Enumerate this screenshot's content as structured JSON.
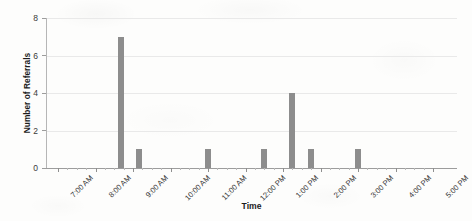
{
  "chart_data": {
    "type": "bar",
    "title": "",
    "xlabel": "Time",
    "ylabel": "Number of Referrals",
    "ylim": [
      0,
      8
    ],
    "yticks": [
      0,
      2,
      4,
      6,
      8
    ],
    "ytick_labels": [
      "0",
      "2",
      "4",
      "6",
      "8"
    ],
    "xlim_labels": [
      "7:00 AM",
      "5:00 PM"
    ],
    "xtick_labels": [
      "7:00 AM",
      "8:00 AM",
      "9:00 AM",
      "10:00 AM",
      "11:00 AM",
      "12:00 PM",
      "1:00 PM",
      "2:00 PM",
      "3:00 PM",
      "4:00 PM",
      "5:00 PM"
    ],
    "grid": "horizontal",
    "legend": "none",
    "bar_color": "#8d8d8d",
    "categories": [
      "8:40 AM",
      "9:10 AM",
      "11:00 AM",
      "12:30 PM",
      "1:15 PM",
      "1:45 PM",
      "3:00 PM"
    ],
    "values": [
      7,
      1,
      1,
      1,
      4,
      1,
      1
    ],
    "points": [
      {
        "time": "8:40 AM",
        "value": 7
      },
      {
        "time": "9:10 AM",
        "value": 1
      },
      {
        "time": "11:00 AM",
        "value": 1
      },
      {
        "time": "12:30 PM",
        "value": 1
      },
      {
        "time": "1:15 PM",
        "value": 4
      },
      {
        "time": "1:45 PM",
        "value": 1
      },
      {
        "time": "3:00 PM",
        "value": 1
      }
    ]
  },
  "colors": {
    "bar": "#8d8d8d",
    "grid": "#e9e9e9",
    "axis": "#9c9c9c",
    "text": "#333333",
    "background": "#fdfdfc"
  }
}
